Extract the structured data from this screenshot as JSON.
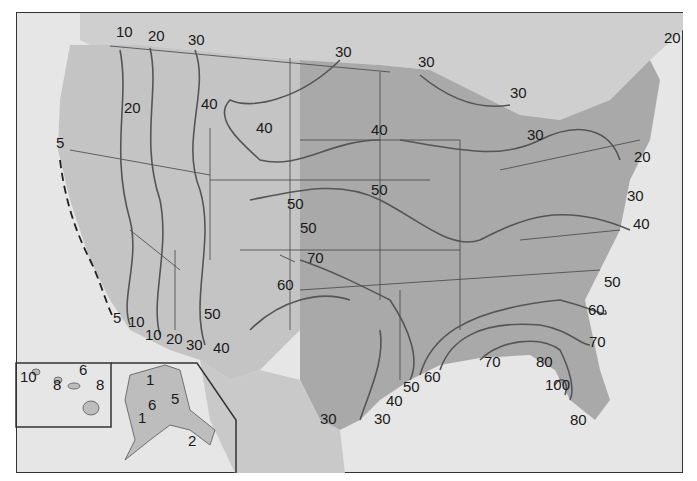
{
  "map": {
    "type": "isoline",
    "subject": "United States contour map",
    "colors": {
      "water": "#e6e6e6",
      "land_west": "#c8c8c8",
      "land_east": "#a8a8a8",
      "isoline": "#555555",
      "border": "#333333",
      "text": "#1a1a1a"
    },
    "contour_labels": [
      {
        "id": "l1",
        "text": "10",
        "x": 116,
        "y": 32
      },
      {
        "id": "l2",
        "text": "20",
        "x": 148,
        "y": 36
      },
      {
        "id": "l3",
        "text": "30",
        "x": 188,
        "y": 40
      },
      {
        "id": "l4",
        "text": "30",
        "x": 335,
        "y": 52
      },
      {
        "id": "l5",
        "text": "30",
        "x": 418,
        "y": 62
      },
      {
        "id": "l6",
        "text": "30",
        "x": 510,
        "y": 93
      },
      {
        "id": "l7",
        "text": "20",
        "x": 664,
        "y": 38
      },
      {
        "id": "l8",
        "text": "20",
        "x": 124,
        "y": 108
      },
      {
        "id": "l9",
        "text": "40",
        "x": 201,
        "y": 104
      },
      {
        "id": "l10",
        "text": "40",
        "x": 256,
        "y": 128
      },
      {
        "id": "l11",
        "text": "40",
        "x": 371,
        "y": 130
      },
      {
        "id": "l12",
        "text": "30",
        "x": 527,
        "y": 135
      },
      {
        "id": "l13",
        "text": "20",
        "x": 634,
        "y": 157
      },
      {
        "id": "l14",
        "text": "5",
        "x": 56,
        "y": 143
      },
      {
        "id": "l15",
        "text": "50",
        "x": 371,
        "y": 190
      },
      {
        "id": "l16",
        "text": "50",
        "x": 287,
        "y": 204
      },
      {
        "id": "l17",
        "text": "50",
        "x": 300,
        "y": 228
      },
      {
        "id": "l18",
        "text": "30",
        "x": 627,
        "y": 196
      },
      {
        "id": "l19",
        "text": "40",
        "x": 633,
        "y": 224
      },
      {
        "id": "l20",
        "text": "70",
        "x": 307,
        "y": 258
      },
      {
        "id": "l21",
        "text": "60",
        "x": 277,
        "y": 285
      },
      {
        "id": "l22",
        "text": "50",
        "x": 604,
        "y": 282
      },
      {
        "id": "l23",
        "text": "60",
        "x": 588,
        "y": 310
      },
      {
        "id": "l24",
        "text": "70",
        "x": 589,
        "y": 342
      },
      {
        "id": "l25",
        "text": "50",
        "x": 204,
        "y": 314
      },
      {
        "id": "l26",
        "text": "5",
        "x": 113,
        "y": 318
      },
      {
        "id": "l27",
        "text": "10",
        "x": 128,
        "y": 322
      },
      {
        "id": "l28",
        "text": "10",
        "x": 145,
        "y": 335
      },
      {
        "id": "l29",
        "text": "20",
        "x": 166,
        "y": 339
      },
      {
        "id": "l30",
        "text": "30",
        "x": 186,
        "y": 345
      },
      {
        "id": "l31",
        "text": "40",
        "x": 213,
        "y": 348
      },
      {
        "id": "l32",
        "text": "70",
        "x": 484,
        "y": 362
      },
      {
        "id": "l33",
        "text": "80",
        "x": 536,
        "y": 362
      },
      {
        "id": "l34",
        "text": "60",
        "x": 424,
        "y": 377
      },
      {
        "id": "l35",
        "text": "50",
        "x": 403,
        "y": 387
      },
      {
        "id": "l36",
        "text": "100",
        "x": 545,
        "y": 385
      },
      {
        "id": "l37",
        "text": "40",
        "x": 386,
        "y": 401
      },
      {
        "id": "l38",
        "text": "30",
        "x": 320,
        "y": 419
      },
      {
        "id": "l39",
        "text": "30",
        "x": 374,
        "y": 419
      },
      {
        "id": "l40",
        "text": "80",
        "x": 570,
        "y": 420
      },
      {
        "id": "l41",
        "text": "10",
        "x": 20,
        "y": 377
      },
      {
        "id": "l42",
        "text": "6",
        "x": 79,
        "y": 370
      },
      {
        "id": "l43",
        "text": "8",
        "x": 53,
        "y": 385
      },
      {
        "id": "l44",
        "text": "8",
        "x": 96,
        "y": 385
      },
      {
        "id": "l45",
        "text": "1",
        "x": 146,
        "y": 380
      },
      {
        "id": "l46",
        "text": "5",
        "x": 171,
        "y": 399
      },
      {
        "id": "l47",
        "text": "6",
        "x": 148,
        "y": 405
      },
      {
        "id": "l48",
        "text": "1",
        "x": 138,
        "y": 418
      },
      {
        "id": "l49",
        "text": "2",
        "x": 188,
        "y": 441
      }
    ]
  }
}
